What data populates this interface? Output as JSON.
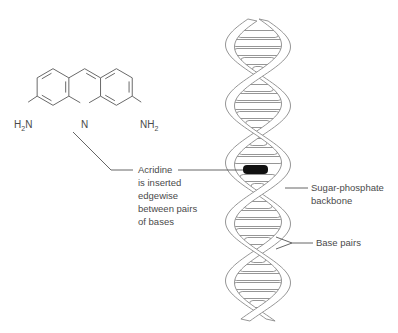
{
  "molecule": {
    "name": "Acridine",
    "left_group": {
      "main": "H",
      "sub": "2",
      "tail": "N"
    },
    "ring_nitrogen": "N",
    "right_group": {
      "main": "NH",
      "sub": "2"
    }
  },
  "labels": {
    "acridine": [
      "Acridine",
      "is inserted",
      "edgewise",
      "between pairs",
      "of bases"
    ],
    "backbone": [
      "Sugar-phosphate",
      "backbone"
    ],
    "base_pairs": "Base pairs"
  },
  "colors": {
    "line": "#6a6a6a",
    "intercalator": "#111111",
    "text": "#4a4a4a"
  }
}
